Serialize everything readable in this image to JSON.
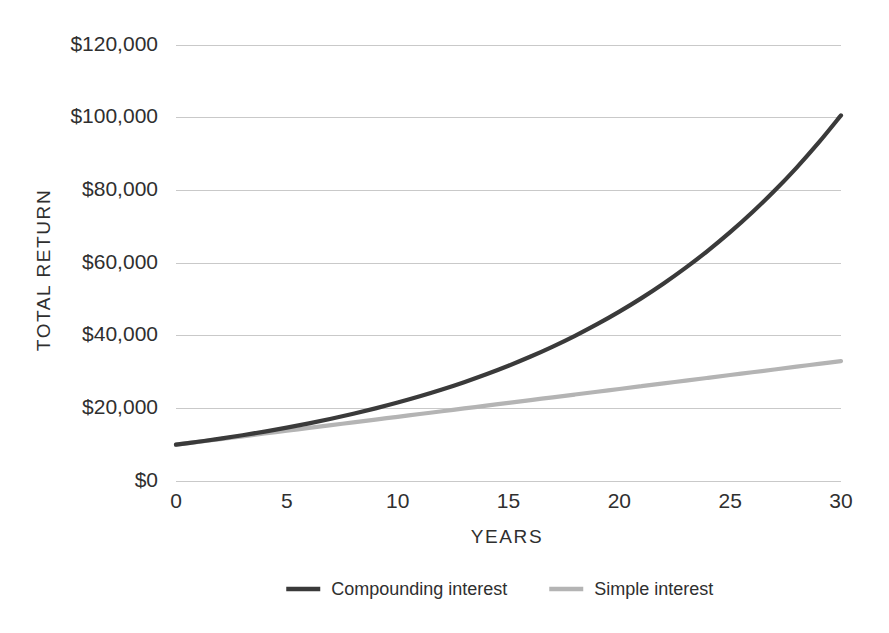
{
  "chart_data": {
    "type": "line",
    "title": "",
    "subtitle": "",
    "xlabel": "YEARS",
    "ylabel": "TOTAL RETURN",
    "xlim": [
      0,
      30
    ],
    "ylim": [
      0,
      120000
    ],
    "grid": true,
    "legend_position": "bottom",
    "x_ticks": [
      0,
      5,
      10,
      15,
      20,
      25,
      30
    ],
    "x_tick_labels": [
      "0",
      "5",
      "10",
      "15",
      "20",
      "25",
      "30"
    ],
    "y_ticks": [
      0,
      20000,
      40000,
      60000,
      80000,
      100000,
      120000
    ],
    "y_tick_labels": [
      "$0",
      "$20,000",
      "$40,000",
      "$60,000",
      "$80,000",
      "$100,000",
      "$120,000"
    ],
    "x": [
      0,
      1,
      2,
      3,
      4,
      5,
      6,
      7,
      8,
      9,
      10,
      11,
      12,
      13,
      14,
      15,
      16,
      17,
      18,
      19,
      20,
      21,
      22,
      23,
      24,
      25,
      26,
      27,
      28,
      29,
      30
    ],
    "series": [
      {
        "name": "Compounding interest",
        "color": "#3a3a3a",
        "width": 4.2,
        "values": [
          10000,
          10800,
          11664,
          12597,
          13605,
          14693,
          15869,
          17138,
          18509,
          19990,
          21589,
          23316,
          25182,
          27196,
          29372,
          31722,
          34259,
          37000,
          39960,
          43157,
          46610,
          50338,
          54365,
          58715,
          63412,
          68485,
          73964,
          79881,
          86271,
          93173,
          100627
        ]
      },
      {
        "name": "Simple interest",
        "color": "#b4b4b4",
        "width": 4.2,
        "values": [
          10000,
          10767,
          11533,
          12300,
          13067,
          13833,
          14600,
          15367,
          16133,
          16900,
          17667,
          18433,
          19200,
          19967,
          20733,
          21500,
          22267,
          23033,
          23800,
          24567,
          25333,
          26100,
          26867,
          27633,
          28400,
          29167,
          29933,
          30700,
          31467,
          32233,
          33000
        ]
      }
    ],
    "annotations": []
  },
  "legend": {
    "items": [
      {
        "label": "Compounding interest",
        "color": "#3a3a3a"
      },
      {
        "label": "Simple interest",
        "color": "#b4b4b4"
      }
    ]
  },
  "colors": {
    "background": "#ffffff",
    "text": "#2f2f2f",
    "gridline": "#c9c9c9",
    "compounding": "#3a3a3a",
    "simple": "#b4b4b4"
  }
}
